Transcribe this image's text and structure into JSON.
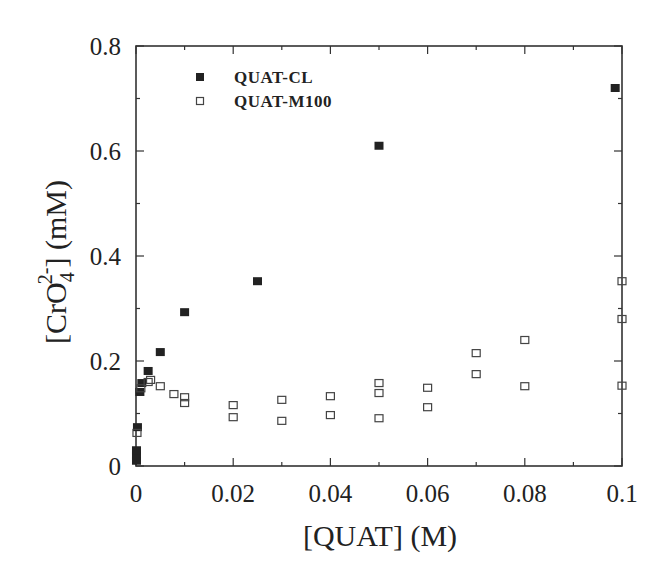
{
  "chart_data": {
    "type": "scatter",
    "title": "",
    "xlabel": "[QUAT] (M)",
    "ylabel": "[CrO4 2-] (mM)",
    "ylabel_parts": {
      "prefix": "[CrO",
      "sub": "4",
      "sup": "2-",
      "suffix": "] (mM)"
    },
    "xlim": [
      0,
      0.1
    ],
    "ylim": [
      0,
      0.8
    ],
    "x_ticks": [
      0,
      0.02,
      0.04,
      0.06,
      0.08,
      0.1
    ],
    "x_tick_labels": [
      "0",
      "0.02",
      "0.04",
      "0.06",
      "0.08",
      "0.1"
    ],
    "x_minor_ticks": [
      0.01,
      0.03,
      0.05,
      0.07,
      0.09
    ],
    "y_ticks": [
      0,
      0.2,
      0.4,
      0.6,
      0.8
    ],
    "y_tick_labels": [
      "0",
      "0.2",
      "0.4",
      "0.6",
      "0.8"
    ],
    "y_minor_ticks": [
      0.1,
      0.3,
      0.5,
      0.7
    ],
    "grid": false,
    "legend_position": "upper left",
    "series": [
      {
        "name": "QUAT-CL",
        "marker": "filled-square",
        "color": "#222222",
        "points": [
          [
            0.0001,
            0.01
          ],
          [
            0.0001,
            0.02
          ],
          [
            0.0001,
            0.03
          ],
          [
            0.0003,
            0.074
          ],
          [
            0.0008,
            0.141
          ],
          [
            0.0012,
            0.158
          ],
          [
            0.0025,
            0.181
          ],
          [
            0.005,
            0.217
          ],
          [
            0.01,
            0.293
          ],
          [
            0.025,
            0.352
          ],
          [
            0.05,
            0.61
          ],
          [
            0.0986,
            0.72
          ]
        ]
      },
      {
        "name": "QUAT-M100",
        "marker": "open-square",
        "color": "#444444",
        "points": [
          [
            0.0002,
            0.063
          ],
          [
            0.001,
            0.148
          ],
          [
            0.0025,
            0.16
          ],
          [
            0.003,
            0.164
          ],
          [
            0.005,
            0.152
          ],
          [
            0.0078,
            0.137
          ],
          [
            0.01,
            0.131
          ],
          [
            0.01,
            0.12
          ],
          [
            0.02,
            0.116
          ],
          [
            0.02,
            0.093
          ],
          [
            0.03,
            0.126
          ],
          [
            0.03,
            0.086
          ],
          [
            0.04,
            0.133
          ],
          [
            0.04,
            0.097
          ],
          [
            0.05,
            0.158
          ],
          [
            0.05,
            0.139
          ],
          [
            0.05,
            0.091
          ],
          [
            0.06,
            0.149
          ],
          [
            0.06,
            0.112
          ],
          [
            0.07,
            0.215
          ],
          [
            0.07,
            0.175
          ],
          [
            0.08,
            0.24
          ],
          [
            0.08,
            0.152
          ],
          [
            0.1,
            0.352
          ],
          [
            0.1,
            0.28
          ],
          [
            0.1,
            0.153
          ]
        ]
      }
    ]
  }
}
